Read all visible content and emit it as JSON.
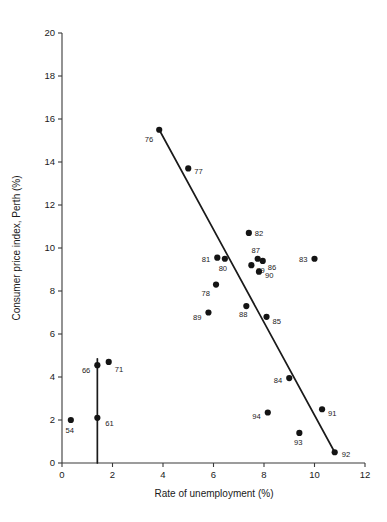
{
  "chart_data": {
    "type": "scatter",
    "title": "",
    "xlabel": "Rate of unemployment (%)",
    "ylabel": "Consumer price index, Perth (%)",
    "xlim": [
      0,
      12
    ],
    "ylim": [
      0,
      20
    ],
    "xticks": [
      0,
      2,
      4,
      6,
      8,
      10,
      12
    ],
    "yticks": [
      0,
      2,
      4,
      6,
      8,
      10,
      12,
      14,
      16,
      18,
      20
    ],
    "grid": false,
    "legend": "none",
    "point_label_field": "year (two digit)",
    "points": [
      {
        "label": "54",
        "x": 0.35,
        "y": 2.0,
        "lx": -1,
        "ly": 11,
        "anchor": "lbl-c"
      },
      {
        "label": "61",
        "x": 1.4,
        "y": 2.1,
        "lx": 8,
        "ly": 6,
        "anchor": "lbl-r"
      },
      {
        "label": "66",
        "x": 1.4,
        "y": 4.55,
        "lx": -7,
        "ly": 6,
        "anchor": "lbl-l"
      },
      {
        "label": "71",
        "x": 1.85,
        "y": 4.7,
        "lx": 6,
        "ly": 8,
        "anchor": "lbl-r"
      },
      {
        "label": "76",
        "x": 3.85,
        "y": 15.5,
        "lx": -6,
        "ly": 10,
        "anchor": "lbl-l"
      },
      {
        "label": "77",
        "x": 5.0,
        "y": 13.7,
        "lx": 6,
        "ly": 4,
        "anchor": "lbl-r"
      },
      {
        "label": "78",
        "x": 6.1,
        "y": 8.3,
        "lx": -6,
        "ly": 9,
        "anchor": "lbl-l"
      },
      {
        "label": "79",
        "x": 7.5,
        "y": 9.2,
        "lx": 5,
        "ly": 6,
        "anchor": "lbl-r"
      },
      {
        "label": "80",
        "x": 6.45,
        "y": 9.5,
        "lx": -2,
        "ly": 10,
        "anchor": "lbl-c"
      },
      {
        "label": "81",
        "x": 6.15,
        "y": 9.55,
        "lx": -7,
        "ly": 2,
        "anchor": "lbl-l"
      },
      {
        "label": "82",
        "x": 7.4,
        "y": 10.7,
        "lx": 6,
        "ly": 1,
        "anchor": "lbl-r"
      },
      {
        "label": "83",
        "x": 10.0,
        "y": 9.5,
        "lx": -7,
        "ly": 1,
        "anchor": "lbl-l"
      },
      {
        "label": "84",
        "x": 9.0,
        "y": 3.95,
        "lx": -7,
        "ly": 3,
        "anchor": "lbl-l"
      },
      {
        "label": "85",
        "x": 8.1,
        "y": 6.8,
        "lx": 6,
        "ly": 5,
        "anchor": "lbl-r"
      },
      {
        "label": "86",
        "x": 7.95,
        "y": 9.4,
        "lx": 5,
        "ly": 7,
        "anchor": "lbl-r"
      },
      {
        "label": "87",
        "x": 7.75,
        "y": 9.5,
        "lx": -2,
        "ly": -8,
        "anchor": "lbl-c"
      },
      {
        "label": "88",
        "x": 7.3,
        "y": 7.3,
        "lx": -3,
        "ly": 9,
        "anchor": "lbl-c"
      },
      {
        "label": "89",
        "x": 5.8,
        "y": 7.0,
        "lx": -7,
        "ly": 5,
        "anchor": "lbl-l"
      },
      {
        "label": "90",
        "x": 7.8,
        "y": 8.9,
        "lx": 6,
        "ly": 4,
        "anchor": "lbl-r"
      },
      {
        "label": "91",
        "x": 10.3,
        "y": 2.5,
        "lx": 6,
        "ly": 5,
        "anchor": "lbl-r"
      },
      {
        "label": "92",
        "x": 10.8,
        "y": 0.5,
        "lx": 7,
        "ly": 3,
        "anchor": "lbl-r"
      },
      {
        "label": "93",
        "x": 9.4,
        "y": 1.4,
        "lx": -1,
        "ly": 10,
        "anchor": "lbl-c"
      },
      {
        "label": "94",
        "x": 8.15,
        "y": 2.35,
        "lx": -7,
        "ly": 5,
        "anchor": "lbl-l"
      }
    ],
    "lines": [
      {
        "name": "main-trend-line",
        "x1": 3.85,
        "y1": 15.5,
        "x2": 10.8,
        "y2": 0.5
      },
      {
        "name": "early-period-line",
        "x1": 1.4,
        "y1": 4.85,
        "x2": 1.4,
        "y2": 0.0
      }
    ]
  }
}
